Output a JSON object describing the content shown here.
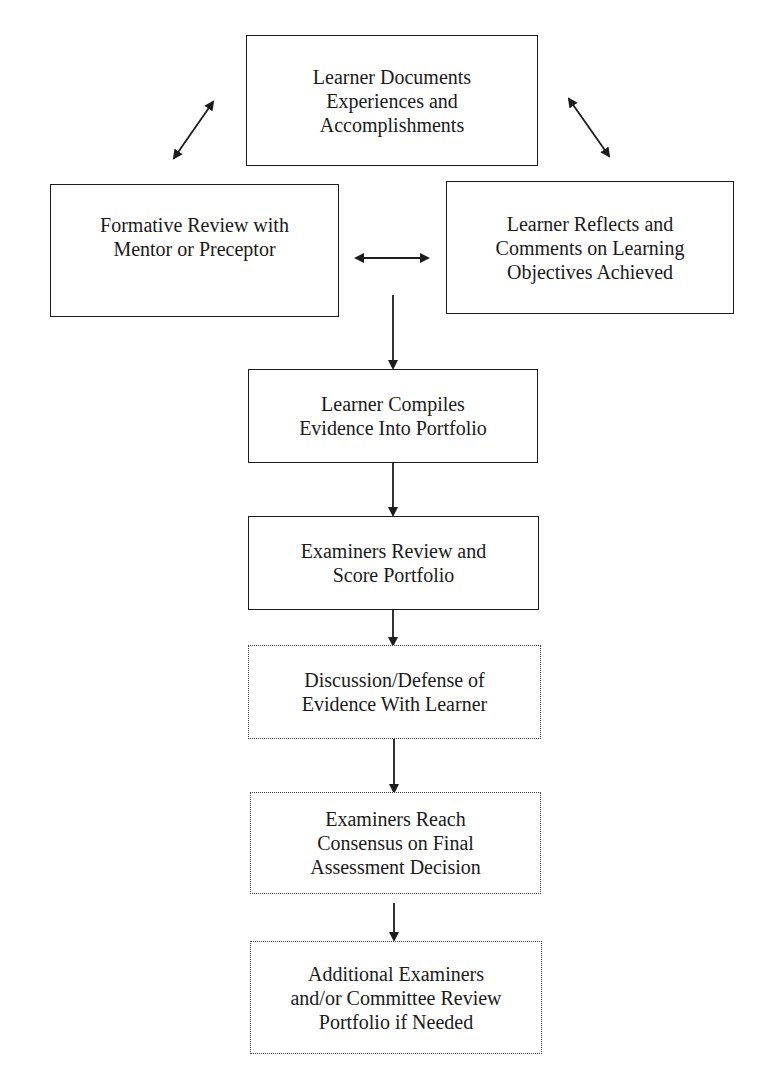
{
  "diagram": {
    "type": "flowchart",
    "colors": {
      "line": "#1c1c1c",
      "background": "#ffffff"
    },
    "nodes": [
      {
        "id": "documents",
        "label": "Learner Documents\nExperiences and\nAccomplishments",
        "border": "solid"
      },
      {
        "id": "formative_review",
        "label": "Formative Review with\nMentor or Preceptor",
        "border": "solid"
      },
      {
        "id": "reflects",
        "label": "Learner Reflects and\nComments on Learning\nObjectives Achieved",
        "border": "solid"
      },
      {
        "id": "compiles",
        "label": "Learner Compiles\nEvidence Into Portfolio",
        "border": "solid"
      },
      {
        "id": "examiners_review",
        "label": "Examiners Review and\nScore Portfolio",
        "border": "solid"
      },
      {
        "id": "discussion",
        "label": "Discussion/Defense of\nEvidence With Learner",
        "border": "dotted"
      },
      {
        "id": "consensus",
        "label": "Examiners Reach\nConsensus on Final\nAssessment Decision",
        "border": "dotted"
      },
      {
        "id": "additional",
        "label": "Additional Examiners\nand/or Committee Review\nPortfolio if Needed",
        "border": "dotted"
      }
    ],
    "edges": [
      {
        "from": "documents",
        "to": "formative_review",
        "direction": "both"
      },
      {
        "from": "documents",
        "to": "reflects",
        "direction": "both"
      },
      {
        "from": "formative_review",
        "to": "reflects",
        "direction": "both"
      },
      {
        "from": "cycle",
        "to": "compiles",
        "direction": "forward"
      },
      {
        "from": "compiles",
        "to": "examiners_review",
        "direction": "forward"
      },
      {
        "from": "examiners_review",
        "to": "discussion",
        "direction": "forward"
      },
      {
        "from": "discussion",
        "to": "consensus",
        "direction": "forward"
      },
      {
        "from": "consensus",
        "to": "additional",
        "direction": "forward"
      }
    ]
  }
}
